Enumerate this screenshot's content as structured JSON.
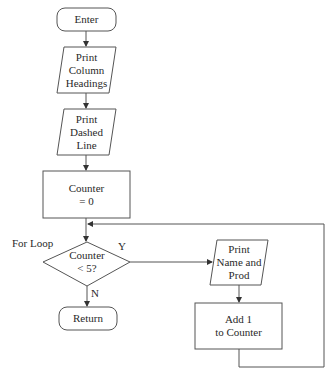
{
  "diagram": {
    "type": "flowchart",
    "nodes": [
      {
        "id": "enter",
        "shape": "terminal",
        "text": "Enter"
      },
      {
        "id": "print_headings",
        "shape": "io",
        "line1": "Print",
        "line2": "Column",
        "line3": "Headings"
      },
      {
        "id": "print_dashed",
        "shape": "io",
        "line1": "Print",
        "line2": "Dashed",
        "line3": "Line"
      },
      {
        "id": "counter_init",
        "shape": "process",
        "line1": "Counter",
        "line2": "= 0"
      },
      {
        "id": "decision",
        "shape": "decision",
        "line1": "Counter",
        "line2": "< 5?"
      },
      {
        "id": "print_name",
        "shape": "io",
        "line1": "Print",
        "line2": "Name and",
        "line3": "Prod"
      },
      {
        "id": "add_one",
        "shape": "process",
        "line1": "Add 1",
        "line2": "to Counter"
      },
      {
        "id": "return",
        "shape": "terminal",
        "text": "Return"
      }
    ],
    "labels": {
      "loop": "For Loop",
      "yes": "Y",
      "no": "N"
    },
    "edges": [
      {
        "from": "enter",
        "to": "print_headings"
      },
      {
        "from": "print_headings",
        "to": "print_dashed"
      },
      {
        "from": "print_dashed",
        "to": "counter_init"
      },
      {
        "from": "counter_init",
        "to": "decision"
      },
      {
        "from": "decision",
        "to": "print_name",
        "label": "Y"
      },
      {
        "from": "decision",
        "to": "return",
        "label": "N"
      },
      {
        "from": "print_name",
        "to": "add_one"
      },
      {
        "from": "add_one",
        "to": "decision",
        "note": "loop back"
      }
    ]
  }
}
